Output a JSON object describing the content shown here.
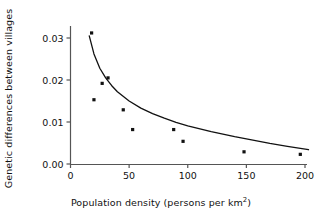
{
  "chart_data": {
    "type": "scatter",
    "title": "",
    "subtitle": "",
    "xlabel_prefix": "Population density (persons per km",
    "xlabel_sup": "2",
    "xlabel_suffix": ")",
    "xlabel": "Population density (persons per km2)",
    "ylabel": "Genetic differences between villages",
    "xlim": [
      0,
      205
    ],
    "ylim": [
      0.0,
      0.0335
    ],
    "grid": false,
    "legend": false,
    "legend_position": "none",
    "xticks": [
      0,
      50,
      100,
      150,
      200
    ],
    "xtick_labels": [
      "0",
      "50",
      "100",
      "150",
      "200"
    ],
    "yticks": [
      0.0,
      0.01,
      0.02,
      0.03
    ],
    "ytick_labels": [
      "0.00",
      "0.01",
      "0.02",
      "0.03"
    ],
    "marker": "square",
    "marker_color": "#111111",
    "marker_size": 3.2,
    "line_color": "#111111",
    "axis_color": "#555555",
    "points": [
      {
        "x": 18,
        "y": 0.0312
      },
      {
        "x": 20,
        "y": 0.0153
      },
      {
        "x": 27,
        "y": 0.0192
      },
      {
        "x": 32,
        "y": 0.0205
      },
      {
        "x": 45,
        "y": 0.0129
      },
      {
        "x": 53,
        "y": 0.0082
      },
      {
        "x": 88,
        "y": 0.0082
      },
      {
        "x": 96,
        "y": 0.0054
      },
      {
        "x": 148,
        "y": 0.0029
      },
      {
        "x": 196,
        "y": 0.0023
      }
    ],
    "x": [
      18,
      20,
      27,
      32,
      45,
      53,
      88,
      96,
      148,
      196
    ],
    "values": [
      0.0312,
      0.0153,
      0.0192,
      0.0205,
      0.0129,
      0.0082,
      0.0082,
      0.0054,
      0.0029,
      0.0023
    ],
    "fit_curve": {
      "type": "power-decay",
      "description": "fitted decreasing curve through scatter",
      "x_start": 16,
      "x_end": 203,
      "points": [
        {
          "x": 16,
          "y": 0.0305
        },
        {
          "x": 20,
          "y": 0.0262
        },
        {
          "x": 25,
          "y": 0.0228
        },
        {
          "x": 30,
          "y": 0.0205
        },
        {
          "x": 35,
          "y": 0.0187
        },
        {
          "x": 40,
          "y": 0.0172
        },
        {
          "x": 50,
          "y": 0.015
        },
        {
          "x": 60,
          "y": 0.0133
        },
        {
          "x": 70,
          "y": 0.012
        },
        {
          "x": 80,
          "y": 0.0109
        },
        {
          "x": 90,
          "y": 0.0099
        },
        {
          "x": 100,
          "y": 0.0091
        },
        {
          "x": 120,
          "y": 0.0077
        },
        {
          "x": 140,
          "y": 0.0065
        },
        {
          "x": 150,
          "y": 0.006
        },
        {
          "x": 170,
          "y": 0.0049
        },
        {
          "x": 185,
          "y": 0.0042
        },
        {
          "x": 203,
          "y": 0.0034
        }
      ]
    }
  }
}
